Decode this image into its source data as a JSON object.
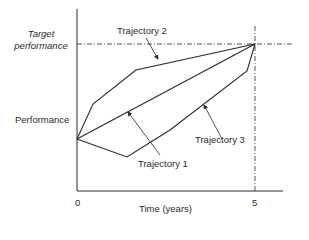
{
  "diagram": {
    "y_axis_label": "Performance",
    "target_label_line1": "Target",
    "target_label_line2": "performance",
    "x_axis_label": "Time (years)",
    "x_tick_start": "0",
    "x_tick_end": "5",
    "trajectories": [
      {
        "label": "Trajectory 1",
        "shape": "straight line from start to target"
      },
      {
        "label": "Trajectory 2",
        "shape": "rapid early rise, then slower approach to target"
      },
      {
        "label": "Trajectory 3",
        "shape": "initial dip, then steep rise to target"
      }
    ],
    "line_color": "#2a2a2a",
    "guide_style": "dash-dot"
  }
}
